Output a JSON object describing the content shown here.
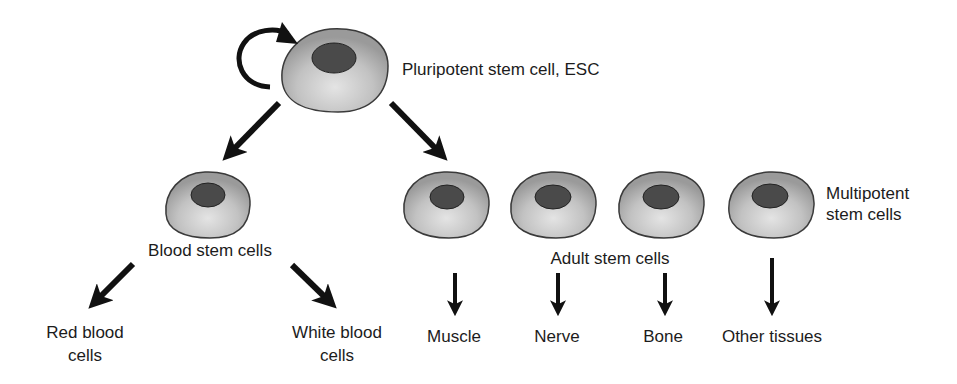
{
  "diagram": {
    "colors": {
      "cell_fill_light": "#dedede",
      "cell_fill_dark": "#9a9a9a",
      "cell_outline": "#3a3a3a",
      "nucleus": "#4a4a4a",
      "arrow": "#111111",
      "background": "#ffffff"
    },
    "nodes": {
      "pluripotent": {
        "label": "Pluripotent stem cell, ESC"
      },
      "blood_stem": {
        "label": "Blood stem cells"
      },
      "adult_stem": {
        "label": "Adult stem cells"
      },
      "multipotent": {
        "label_line1": "Multipotent",
        "label_line2": "stem cells"
      }
    },
    "outputs": {
      "red_blood": {
        "line1": "Red blood",
        "line2": "cells"
      },
      "white_blood": {
        "line1": "White blood",
        "line2": "cells"
      },
      "muscle": "Muscle",
      "nerve": "Nerve",
      "bone": "Bone",
      "other": "Other tissues"
    },
    "edges": [
      {
        "from": "pluripotent",
        "to": "pluripotent",
        "type": "self-renewal"
      },
      {
        "from": "pluripotent",
        "to": "blood_stem"
      },
      {
        "from": "pluripotent",
        "to": "adult_stem"
      },
      {
        "from": "blood_stem",
        "to": "red_blood"
      },
      {
        "from": "blood_stem",
        "to": "white_blood"
      },
      {
        "from": "adult_stem",
        "to": "muscle"
      },
      {
        "from": "adult_stem",
        "to": "nerve"
      },
      {
        "from": "adult_stem",
        "to": "bone"
      },
      {
        "from": "adult_stem",
        "to": "other"
      }
    ]
  }
}
